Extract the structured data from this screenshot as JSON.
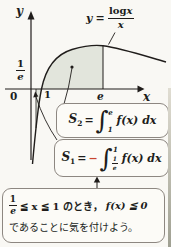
{
  "palette": {
    "paper": "#f9f8f4",
    "ink": "#201d1b",
    "region_fill": "#e2e5dc",
    "box_border": "#8d8781",
    "box_bg": "#fcfbf7",
    "minus_red": "#c9452f"
  },
  "graph": {
    "y_axis_label": "y",
    "x_axis_label": "x",
    "origin_label": "0",
    "tick_one": "1",
    "tick_e": "e",
    "tick_inv_e": {
      "num": "1",
      "den": "e"
    },
    "curve_label": {
      "lhs": "y",
      "eq": "=",
      "num_fn": "log",
      "num_var": "x",
      "den": "x"
    },
    "shaded_regions": [
      "between curve and x-axis from x=1 to x=e (above axis)",
      "between curve, x-axis and line x=1/e (below axis)"
    ]
  },
  "formulas": {
    "s2": {
      "name": "S",
      "sub": "2",
      "eq": "=",
      "integral": "∫",
      "upper": "e",
      "lower": "1",
      "body": "f(x) dx"
    },
    "s1": {
      "name": "S",
      "sub": "1",
      "eq": "=",
      "minus": "−",
      "integral": "∫",
      "upper": "1",
      "lower_num": "1",
      "lower_den": "e",
      "body": "f(x) dx"
    }
  },
  "note": {
    "frac_num": "1",
    "frac_den": "e",
    "line1_mid": "≦ x ≦ 1 のとき，",
    "line1_tail": "f(x) ≦ 0",
    "line2": "であることに気を付けよう。"
  }
}
